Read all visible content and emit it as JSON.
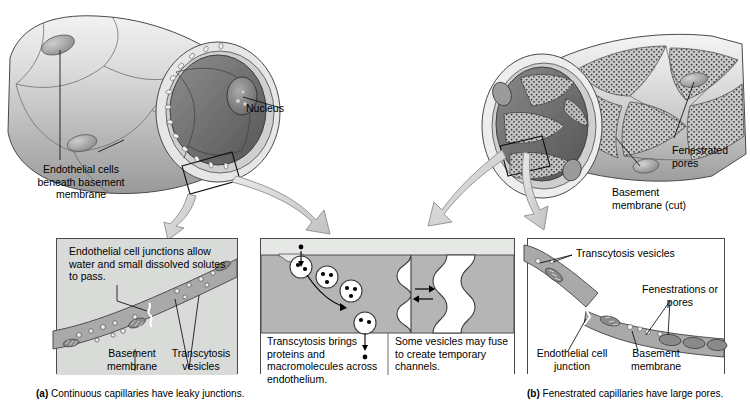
{
  "figure": {
    "background_color": "#ffffff",
    "panel_fill": "#d9dbd9",
    "membrane_fill": "#a9a9a9",
    "line_color": "#000000"
  },
  "left_illustration": {
    "name": "continuous-capillary-vessel",
    "labels": [
      {
        "id": "nucleus",
        "text": "Nucleus"
      },
      {
        "id": "endothelial-cells",
        "text": "Endothelial cells\nbeneath basement\nmembrane"
      }
    ]
  },
  "right_illustration": {
    "name": "fenestrated-capillary-vessel",
    "labels": [
      {
        "id": "fenestrated-pores",
        "text": "Fenestrated\npores"
      },
      {
        "id": "basement-membrane-cut",
        "text": "Basement\nmembrane (cut)"
      }
    ]
  },
  "panels": [
    {
      "id": "panel-a-left",
      "name": "continuous-capillary-detail",
      "texts": [
        {
          "id": "junction-note",
          "text": "Endothelial cell junctions\nallow water and small\ndissolved solutes to pass."
        },
        {
          "id": "basement-membrane",
          "text": "Basement\nmembrane"
        },
        {
          "id": "transcytosis-vesicles",
          "text": "Transcytosis\nvesicles"
        }
      ]
    },
    {
      "id": "panel-a-middle",
      "name": "transcytosis-detail",
      "texts": [
        {
          "id": "transcytosis-note",
          "text": "Transcytosis brings proteins\nand macromolecules across\nendothelium."
        },
        {
          "id": "channels-note",
          "text": "Some vesicles may\nfuse to create\ntemporary channels."
        }
      ]
    },
    {
      "id": "panel-b-right",
      "name": "fenestrated-capillary-detail",
      "texts": [
        {
          "id": "transcytosis-vesicles",
          "text": "Transcytosis vesicles"
        },
        {
          "id": "fenestrations",
          "text": "Fenestrations\nor pores"
        },
        {
          "id": "endothelial-junction",
          "text": "Endothelial cell\njunction"
        },
        {
          "id": "basement-membrane",
          "text": "Basement\nmembrane"
        }
      ]
    }
  ],
  "captions": [
    {
      "id": "caption-a",
      "marker": "(a)",
      "text": "Continuous capillaries have leaky junctions."
    },
    {
      "id": "caption-b",
      "marker": "(b)",
      "text": "Fenestrated capillaries have large pores."
    }
  ]
}
